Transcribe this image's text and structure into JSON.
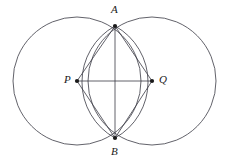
{
  "figure": {
    "kind": "geometry-diagram",
    "width": 230,
    "height": 165,
    "background_color": "#ffffff",
    "stroke_color": "#3a3a44",
    "point_color": "#1a1a1a",
    "stroke_width": 0.8
  },
  "labels": {
    "a": "A",
    "b": "B",
    "p": "P",
    "q": "Q"
  },
  "geometry": {
    "circle_left": {
      "cx": 77,
      "cy": 81,
      "r": 64
    },
    "circle_right": {
      "cx": 152,
      "cy": 81,
      "r": 64
    },
    "point_a": {
      "x": 115,
      "y": 26
    },
    "point_b": {
      "x": 115,
      "y": 138
    },
    "point_p": {
      "x": 77,
      "y": 81
    },
    "point_q": {
      "x": 152,
      "y": 81
    },
    "lens_left_arc": "M 115 26 A 64 64 0 0 0 115 138",
    "lens_right_arc": "M 115 26 A 64 64 0 0 1 115 138",
    "segment_pa": "M 77 81 L 115 26",
    "segment_qa": "M 152 81 L 115 26",
    "segment_pb": "M 77 81 L 115 138",
    "segment_qb": "M 152 81 L 115 138",
    "segment_ab": "M 115 26 L 115 138",
    "segment_pq": "M 77 81 L 152 81",
    "vertex_dot_radius": 2.1
  },
  "label_positions": {
    "a": {
      "left": 111,
      "top": 4
    },
    "b": {
      "left": 111,
      "top": 146
    },
    "p": {
      "left": 64,
      "top": 74
    },
    "q": {
      "left": 159,
      "top": 74
    }
  }
}
